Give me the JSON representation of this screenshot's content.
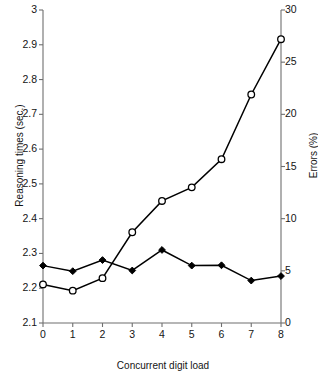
{
  "chart_data": {
    "type": "line",
    "title": "",
    "xlabel": "Concurrent digit load",
    "ylabel": "Reasoning times (sec.)",
    "ylabel_secondary": "Errors (%)",
    "x": [
      0,
      1,
      2,
      3,
      4,
      5,
      6,
      7,
      8
    ],
    "xlim": [
      0,
      8
    ],
    "ylim": [
      2.1,
      3.0
    ],
    "ylim_secondary": [
      0,
      30
    ],
    "xticks": [
      "0",
      "1",
      "2",
      "3",
      "4",
      "5",
      "6",
      "7",
      "8"
    ],
    "yticks": [
      "2.1",
      "2.2",
      "2.3",
      "2.4",
      "2.5",
      "2.6",
      "2.7",
      "2.8",
      "2.9",
      "3"
    ],
    "yticks_secondary": [
      "0",
      "5",
      "10",
      "15",
      "20",
      "25",
      "30"
    ],
    "grid": false,
    "legend": "none",
    "series": [
      {
        "name": "Reasoning times (sec.)",
        "axis": "left",
        "marker": "filled-diamond",
        "color": "#000000",
        "values": [
          2.265,
          2.249,
          2.281,
          2.251,
          2.31,
          2.265,
          2.266,
          2.222,
          2.235
        ]
      },
      {
        "name": "Errors (%)",
        "axis": "right",
        "marker": "open-circle",
        "color": "#000000",
        "values": [
          3.7,
          3.1,
          4.3,
          8.7,
          11.7,
          13.0,
          15.7,
          21.9,
          27.2
        ]
      }
    ]
  },
  "axes": {
    "x_title": "Concurrent digit load",
    "y_left_title": "Reasoning times (sec.)",
    "y_right_title": "Errors (%)"
  }
}
